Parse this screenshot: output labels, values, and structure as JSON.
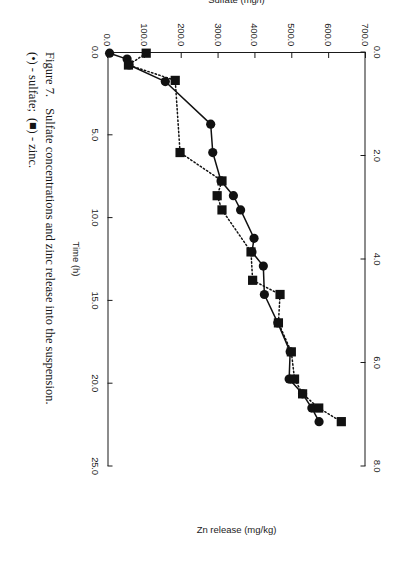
{
  "figure": {
    "number_label": "Figure 7.",
    "caption_line1": "Sulfate concentrations and zinc release into the suspension.",
    "caption_line2_marker_sulfate": "(•) - sulfate;",
    "caption_line2_marker_zinc": "(■) - zinc.",
    "caption_full": "Figure 7.  Sulfate concentrations and zinc release into the suspension. (•) - sulfate; (■) - zinc."
  },
  "colors": {
    "axis": "#1a1a1a",
    "text": "#1c1c1c",
    "series_sulfate": "#111111",
    "series_zinc": "#111111",
    "background": "#ffffff"
  },
  "chart_data": {
    "type": "line",
    "title": "",
    "xlabel": "Time (h)",
    "ylabel": "Sulfate (mg/l)",
    "y2label": "Zn release (mg/kg)",
    "xlim": [
      0.0,
      700.0
    ],
    "ylim": [
      0.0,
      25.0
    ],
    "y2lim": [
      0.0,
      8.0
    ],
    "xticks": [
      "0.0",
      "100.0",
      "200.0",
      "300.0",
      "400.0",
      "500.0",
      "600.0",
      "700.0"
    ],
    "xtick_values": [
      0,
      100,
      200,
      300,
      400,
      500,
      600,
      700
    ],
    "yticks": [
      "0.0",
      "5.0",
      "10.0",
      "15.0",
      "20.0",
      "25.0"
    ],
    "ytick_values": [
      0,
      5,
      10,
      15,
      20,
      25
    ],
    "y2ticks": [
      "0.0",
      "2.0",
      "4.0",
      "6.0",
      "8.0"
    ],
    "y2tick_values": [
      0,
      2,
      4,
      6,
      8
    ],
    "grid": false,
    "legend_position": "caption",
    "series": [
      {
        "name": "sulfate",
        "legend_label": "(•) - sulfate",
        "marker": "circle",
        "linestyle": "solid",
        "axis": "left",
        "units": "mg/l",
        "x": [
          2,
          12,
          22,
          50,
          122,
          170,
          218,
          243,
          267,
          315,
          338,
          362,
          410,
          458,
          507,
          553,
          578,
          602,
          625
        ],
        "values": [
          0.2,
          1.9,
          2.1,
          5.6,
          10.0,
          10.2,
          11.0,
          12.2,
          12.9,
          14.2,
          14.0,
          15.1,
          15.2,
          16.5,
          17.7,
          17.6,
          18.9,
          19.8,
          20.5
        ]
      },
      {
        "name": "zinc",
        "legend_label": "(■) - zinc",
        "marker": "square",
        "linestyle": "dotted",
        "axis": "right",
        "units": "mg/kg",
        "x": [
          2,
          22,
          48,
          170,
          218,
          243,
          267,
          338,
          386,
          410,
          458,
          507,
          553,
          578,
          602,
          625
        ],
        "values": [
          1.2,
          0.65,
          2.1,
          2.25,
          3.55,
          3.4,
          3.55,
          4.45,
          4.5,
          5.35,
          5.3,
          5.7,
          5.8,
          6.05,
          6.55,
          7.25
        ]
      }
    ]
  }
}
